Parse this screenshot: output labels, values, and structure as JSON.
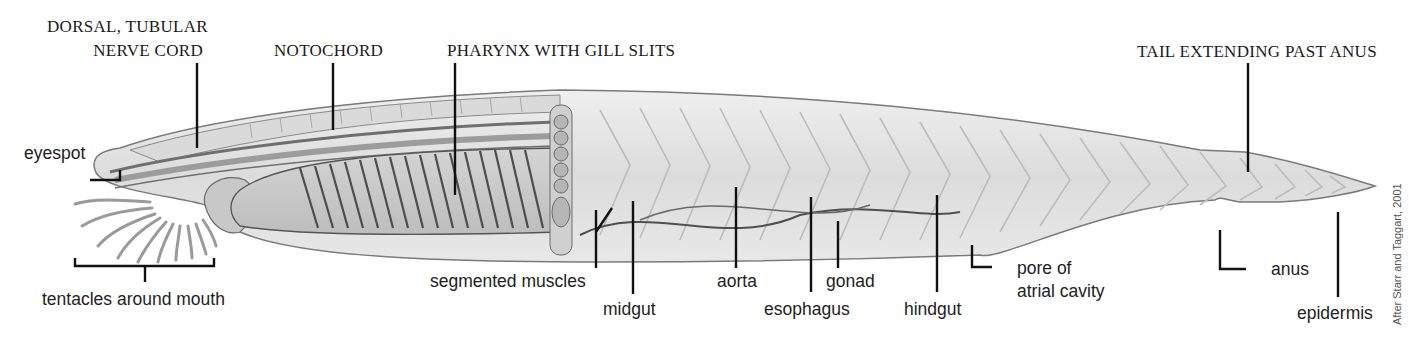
{
  "diagram": {
    "chordate_features": [
      {
        "id": "nerve_cord",
        "line1": "DORSAL, TUBULAR",
        "line2": "NERVE CORD"
      },
      {
        "id": "notochord",
        "label": "NOTOCHORD"
      },
      {
        "id": "pharynx",
        "label": "PHARYNX WITH GILL SLITS"
      },
      {
        "id": "tail",
        "label": "TAIL EXTENDING PAST ANUS"
      }
    ],
    "structures": {
      "eyespot": "eyespot",
      "tentacles": "tentacles around mouth",
      "segmented_muscles": "segmented muscles",
      "midgut": "midgut",
      "aorta": "aorta",
      "esophagus": "esophagus",
      "gonad": "gonad",
      "hindgut": "hindgut",
      "pore_line1": "pore of",
      "pore_line2": "atrial cavity",
      "anus": "anus",
      "epidermis": "epidermis"
    },
    "credit": "After Starr and Taggart, 2001",
    "colors": {
      "body_fill": "#e6e6e6",
      "body_stroke": "#7a7a7a",
      "leader_line": "#111111",
      "text": "#1a1a1a"
    }
  }
}
